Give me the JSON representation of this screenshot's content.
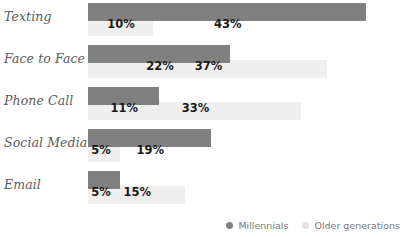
{
  "chart_data": {
    "type": "bar",
    "orientation": "horizontal",
    "title": "",
    "subtitle": "",
    "xlabel": "",
    "ylabel": "",
    "grid": false,
    "legend_position": "bottom-right",
    "xlim": [
      0,
      47
    ],
    "categories": [
      "Texting",
      "Face to Face",
      "Phone Call",
      "Social Media",
      "Email"
    ],
    "series": [
      {
        "name": "Millennials",
        "color": "#808080",
        "values": [
          43,
          22,
          11,
          19,
          5
        ],
        "value_labels": [
          "43%",
          "22%",
          "11%",
          "19%",
          "5%"
        ]
      },
      {
        "name": "Older generations",
        "color": "#efefef",
        "values": [
          10,
          37,
          33,
          5,
          15
        ],
        "value_labels": [
          "10%",
          "37%",
          "33%",
          "5%",
          "15%"
        ]
      }
    ]
  },
  "legend": {
    "items": [
      {
        "label": "Millennials",
        "color": "#808080"
      },
      {
        "label": "Older generations",
        "color": "#e2e2e2"
      }
    ]
  }
}
